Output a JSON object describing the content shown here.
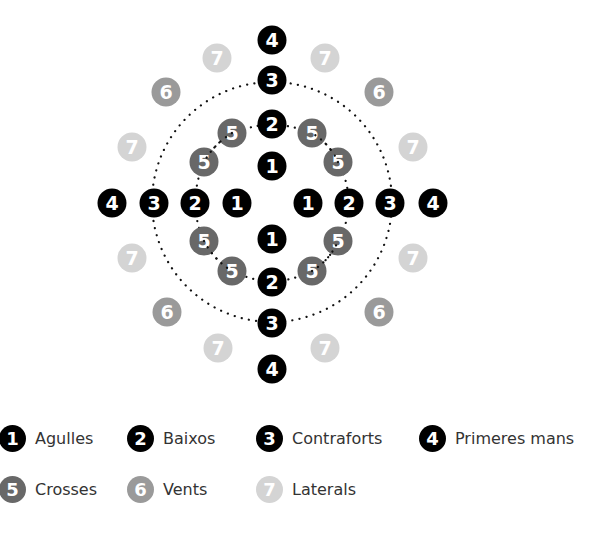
{
  "colors": {
    "1": "#000000",
    "2": "#000000",
    "3": "#000000",
    "4": "#000000",
    "5": "#686868",
    "6": "#9a9a9a",
    "7": "#d4d4d4",
    "dots": "#111111"
  },
  "legend": [
    {
      "num": "1",
      "label": "Agulles"
    },
    {
      "num": "2",
      "label": "Baixos"
    },
    {
      "num": "3",
      "label": "Contraforts"
    },
    {
      "num": "4",
      "label": "Primeres mans"
    },
    {
      "num": "5",
      "label": "Crosses"
    },
    {
      "num": "6",
      "label": "Vents"
    },
    {
      "num": "7",
      "label": "Laterals"
    }
  ],
  "diagram": {
    "center": [
      272,
      202
    ],
    "outer_circle_radius": 120,
    "nodes": [
      {
        "num": "4",
        "x": 272,
        "y": 40
      },
      {
        "num": "7",
        "x": 217,
        "y": 58
      },
      {
        "num": "7",
        "x": 325,
        "y": 58
      },
      {
        "num": "3",
        "x": 272,
        "y": 80
      },
      {
        "num": "6",
        "x": 166,
        "y": 92
      },
      {
        "num": "6",
        "x": 379,
        "y": 92
      },
      {
        "num": "2",
        "x": 272,
        "y": 124
      },
      {
        "num": "5",
        "x": 232,
        "y": 133
      },
      {
        "num": "5",
        "x": 312,
        "y": 133
      },
      {
        "num": "7",
        "x": 132,
        "y": 147
      },
      {
        "num": "7",
        "x": 413,
        "y": 147
      },
      {
        "num": "5",
        "x": 204,
        "y": 162
      },
      {
        "num": "5",
        "x": 338,
        "y": 162
      },
      {
        "num": "1",
        "x": 272,
        "y": 166
      },
      {
        "num": "4",
        "x": 112,
        "y": 203
      },
      {
        "num": "3",
        "x": 154,
        "y": 203
      },
      {
        "num": "2",
        "x": 195,
        "y": 203
      },
      {
        "num": "1",
        "x": 237,
        "y": 203
      },
      {
        "num": "1",
        "x": 308,
        "y": 203
      },
      {
        "num": "2",
        "x": 349,
        "y": 203
      },
      {
        "num": "3",
        "x": 390,
        "y": 203
      },
      {
        "num": "4",
        "x": 433,
        "y": 203
      },
      {
        "num": "1",
        "x": 272,
        "y": 239
      },
      {
        "num": "5",
        "x": 204,
        "y": 241
      },
      {
        "num": "5",
        "x": 338,
        "y": 241
      },
      {
        "num": "7",
        "x": 132,
        "y": 258
      },
      {
        "num": "7",
        "x": 413,
        "y": 258
      },
      {
        "num": "5",
        "x": 232,
        "y": 271
      },
      {
        "num": "5",
        "x": 312,
        "y": 271
      },
      {
        "num": "2",
        "x": 272,
        "y": 282
      },
      {
        "num": "6",
        "x": 167,
        "y": 312
      },
      {
        "num": "6",
        "x": 379,
        "y": 312
      },
      {
        "num": "3",
        "x": 272,
        "y": 323
      },
      {
        "num": "7",
        "x": 218,
        "y": 348
      },
      {
        "num": "7",
        "x": 325,
        "y": 348
      },
      {
        "num": "4",
        "x": 272,
        "y": 369
      }
    ]
  }
}
